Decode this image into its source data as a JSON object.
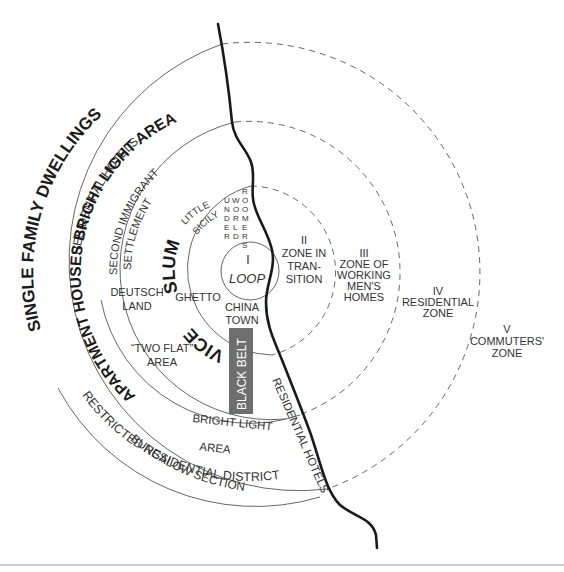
{
  "diagram": {
    "center": [
      250,
      272
    ],
    "zones": [
      {
        "id": "I",
        "numeral": "I",
        "name": "LOOP",
        "radius": 29
      },
      {
        "id": "II",
        "numeral": "II",
        "lines": [
          "ZONE IN",
          "TRAN-",
          "SITION"
        ],
        "radius": 86
      },
      {
        "id": "III",
        "numeral": "III",
        "lines": [
          "ZONE OF",
          "WORKING",
          "MEN'S",
          "HOMES"
        ],
        "radius": 151
      },
      {
        "id": "IV",
        "numeral": "IV",
        "lines": [
          "RESIDENTIAL",
          "ZONE"
        ],
        "radius": 230
      },
      {
        "id": "V",
        "numeral": "V",
        "lines": [
          "COMMUTERS'",
          "ZONE"
        ]
      }
    ],
    "arc_labels": {
      "single_family": "SINGLE FAMILY DWELLINGS",
      "residential_hotels_nw": "RESIDENTIAL HOTELS",
      "apartment_bright": "APARTMENT HOUSES BRIGHT LIGHT AREA",
      "second_immigrant_1": "SECOND IMMIGRANT",
      "second_immigrant_2": "SETTLEMENT",
      "little_sicily_1": "LITTLE",
      "little_sicily_2": "SICILY",
      "slum": "SLUM",
      "vice": "VICE",
      "restricted": "RESTRICTED RESIDENTIAL DISTRICT",
      "bungalow": "BUNGALOW SECTION",
      "residential_hotels_river": "RESIDENTIAL HOTELS"
    },
    "vertical_words": {
      "underworld": "UNDERWORLD",
      "roomers": "ROOMERS"
    },
    "area_labels": {
      "deutschland": [
        "DEUTSCH",
        "LAND"
      ],
      "ghetto": "GHETTO",
      "chinatown": [
        "CHINA",
        "TOWN"
      ],
      "two_flat": [
        "“TWO FLAT”",
        "AREA"
      ],
      "bright_light_south": [
        "BRIGHT LIGHT",
        "AREA"
      ],
      "black_belt": "BLACK BELT"
    },
    "colors": {
      "black_belt_fill": "#6e6e6e",
      "black_belt_text": "#ffffff",
      "river": "#1a1a1a",
      "rings": "#555555",
      "footer_rule": "#9a9a9a"
    }
  }
}
